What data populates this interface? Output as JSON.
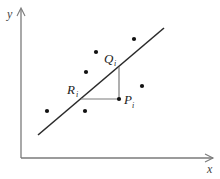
{
  "diagram": {
    "axes": {
      "x_label": "x",
      "y_label": "y"
    },
    "regression_line": {
      "from": [
        38,
        135
      ],
      "to": [
        164,
        28
      ]
    },
    "points": [
      {
        "x": 47,
        "y": 111
      },
      {
        "x": 85,
        "y": 111
      },
      {
        "x": 86,
        "y": 72
      },
      {
        "x": 96,
        "y": 52
      },
      {
        "x": 134,
        "y": 39
      },
      {
        "x": 142,
        "y": 86
      }
    ],
    "labels": {
      "Q": {
        "main": "Q",
        "sub": "i"
      },
      "R": {
        "main": "R",
        "sub": "i"
      },
      "P": {
        "main": "P",
        "sub": "i"
      }
    },
    "special_point_P": {
      "x": 119,
      "y": 99
    },
    "Q_on_line": {
      "x": 119,
      "y": 67
    },
    "R_on_line": {
      "x": 81,
      "y": 99
    }
  }
}
